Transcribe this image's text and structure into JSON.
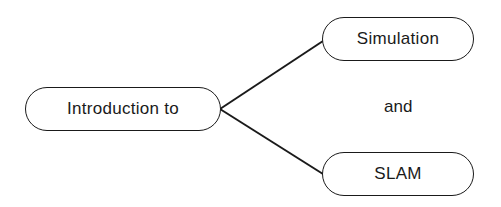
{
  "diagram": {
    "nodes": [
      {
        "id": "root",
        "label": "Introduction to"
      },
      {
        "id": "simulation",
        "label": "Simulation"
      },
      {
        "id": "slam",
        "label": "SLAM"
      }
    ],
    "connector_label": "and",
    "edges": [
      {
        "from": "root",
        "to": "simulation"
      },
      {
        "from": "root",
        "to": "slam"
      }
    ],
    "colors": {
      "stroke": "#1a1a1a",
      "background": "#ffffff"
    }
  }
}
